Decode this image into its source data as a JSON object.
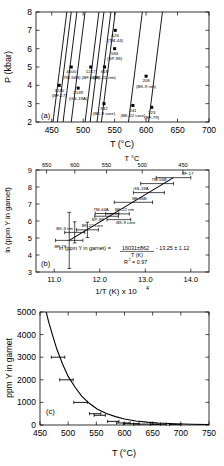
{
  "figure": {
    "panels": [
      "a",
      "b",
      "c"
    ]
  },
  "panel_a": {
    "tag": "(a)",
    "xlabel": "T (°C)",
    "ylabel": "P (kbar)",
    "xticks": [
      "450",
      "500",
      "550",
      "600",
      "650",
      "700"
    ],
    "yticks": [
      "2",
      "3",
      "4",
      "5",
      "6",
      "7",
      "8"
    ],
    "isopleth_labels": [
      "5000",
      "4000",
      "3000",
      "2000",
      "1000",
      "800",
      "600",
      "500",
      "200",
      "100 ppm"
    ],
    "points": [
      {
        "value": "3240",
        "sample": "(BF-17)"
      },
      {
        "value": "4000",
        "sample": "(TM-56B)"
      },
      {
        "value": "2149",
        "sample": "(GS-19A)"
      },
      {
        "value": "1217",
        "sample": "(BF-36B)"
      },
      {
        "value": "626",
        "sample": "(TM-44)"
      },
      {
        "value": "583",
        "sample": "(SP-98)"
      },
      {
        "value": "618",
        "sample": "(BK-22 rim)"
      },
      {
        "value": "332",
        "sample": "(BK-9 core)"
      },
      {
        "value": "208",
        "sample": "(BK-9 rim)"
      },
      {
        "value": "241",
        "sample": "(BK-22 core)"
      },
      {
        "value": "123",
        "sample": "(BF-79)"
      }
    ]
  },
  "panel_b": {
    "tag": "(b)",
    "xlabel_prefix": "1/T (K) x 10",
    "xlabel_exponent": "4",
    "ylabel": "ln (ppm Y in garnet)",
    "top_axis_label": "T °C",
    "xticks": [
      "11.0",
      "12.0",
      "13.0",
      "14.0"
    ],
    "yticks": [
      "3",
      "4",
      "5",
      "6",
      "7",
      "8",
      "9"
    ],
    "top_ticks": [
      "680",
      "650",
      "600",
      "550",
      "500",
      "450"
    ],
    "equation_lhs": "ln (ppm Y in garnet) =",
    "equation_numerator": "16031±862",
    "equation_denominator": "T (K)",
    "equation_intercept": "- 13.25 ± 1.12",
    "r_squared_label": "R",
    "r_squared_exponent": "2",
    "r_squared_value": "= 0.97",
    "sample_labels": [
      "BF-17",
      "TM-56B",
      "GS-19A",
      "BF-36B",
      "TM-44A",
      "SP-98",
      "BK-22 rim",
      "BK-9 core",
      "BK-9 rim",
      "BK-22 core",
      "BF-79"
    ]
  },
  "panel_c": {
    "tag": "(c)",
    "xlabel": "T (°C)",
    "ylabel": "ppm Y in garnet",
    "xticks": [
      "450",
      "500",
      "550",
      "600",
      "650",
      "700",
      "750"
    ],
    "yticks": [
      "0",
      "1000",
      "2000",
      "3000",
      "4000",
      "5000"
    ]
  },
  "chart_data": [
    {
      "type": "line",
      "panel": "a",
      "title": "",
      "xlabel": "T (°C)",
      "ylabel": "P (kbar)",
      "xlim": [
        425,
        700
      ],
      "ylim": [
        2,
        8
      ],
      "grid": false,
      "legend": "none",
      "annotations": [
        "(a)"
      ],
      "series": [
        {
          "name": "5000",
          "x": [
            452,
            474
          ],
          "y": [
            2.0,
            8.0
          ]
        },
        {
          "name": "4000",
          "x": [
            459,
            481
          ],
          "y": [
            2.0,
            8.0
          ]
        },
        {
          "name": "3000",
          "x": [
            468,
            490
          ],
          "y": [
            2.0,
            8.0
          ]
        },
        {
          "name": "2000",
          "x": [
            481,
            503
          ],
          "y": [
            2.0,
            8.0
          ]
        },
        {
          "name": "1000",
          "x": [
            503,
            525
          ],
          "y": [
            2.0,
            8.0
          ]
        },
        {
          "name": "800",
          "x": [
            511,
            533
          ],
          "y": [
            2.0,
            8.0
          ]
        },
        {
          "name": "600",
          "x": [
            522,
            544
          ],
          "y": [
            2.0,
            8.0
          ]
        },
        {
          "name": "500",
          "x": [
            529,
            551
          ],
          "y": [
            2.0,
            8.0
          ]
        },
        {
          "name": "200",
          "x": [
            572,
            594
          ],
          "y": [
            2.0,
            8.0
          ]
        },
        {
          "name": "100 ppm",
          "x": [
            604,
            626
          ],
          "y": [
            2.0,
            8.0
          ]
        }
      ],
      "points": [
        {
          "label": "3240",
          "sample": "(BF-17)",
          "T": 462,
          "P": 4.0
        },
        {
          "label": "4000",
          "sample": "(TM-56B)",
          "T": 481,
          "P": 5.0
        },
        {
          "label": "2149",
          "sample": "(GS-19A)",
          "T": 492,
          "P": 3.85
        },
        {
          "label": "1217",
          "sample": "(BF-36B)",
          "T": 512,
          "P": 5.0
        },
        {
          "label": "626",
          "sample": "(TM-44)",
          "T": 551,
          "P": 7.0
        },
        {
          "label": "583",
          "sample": "(SP-98)",
          "T": 550,
          "P": 6.0
        },
        {
          "label": "618",
          "sample": "(BK-22 rim)",
          "T": 534,
          "P": 5.0
        },
        {
          "label": "332",
          "sample": "(BK-9 core)",
          "T": 533,
          "P": 3.0
        },
        {
          "label": "208",
          "sample": "(BK-9 rim)",
          "T": 600,
          "P": 4.5
        },
        {
          "label": "241",
          "sample": "(BK-22 core)",
          "T": 579,
          "P": 2.9
        },
        {
          "label": "123",
          "sample": "(BF-79)",
          "T": 609,
          "P": 2.8
        }
      ]
    },
    {
      "type": "scatter",
      "panel": "b",
      "title": "",
      "xlabel": "1/T (K) x 10^4",
      "ylabel": "ln (ppm Y in garnet)",
      "xlim": [
        10.6,
        14.4
      ],
      "ylim": [
        3,
        9
      ],
      "grid": false,
      "legend": "none",
      "top_axis": {
        "label": "T °C",
        "ticks": [
          680,
          650,
          600,
          550,
          500,
          450
        ]
      },
      "annotations": [
        "(b)",
        "ln (ppm Y in garnet) = 16031±862 / T (K) - 13.25 ± 1.12",
        "R2 = 0.97"
      ],
      "fit": {
        "slope": 16031,
        "slope_err": 862,
        "intercept": -13.25,
        "intercept_err": 1.12,
        "r2": 0.97,
        "line_x": [
          11.33,
          13.62
        ],
        "line_y": [
          4.86,
          8.55
        ]
      },
      "points": [
        {
          "sample": "BF-17",
          "x": 13.62,
          "y": 8.55,
          "xerr": 0.38
        },
        {
          "sample": "TM-56B",
          "x": 13.26,
          "y": 8.2,
          "xerr": 0.36
        },
        {
          "sample": "GS-19A",
          "x": 13.08,
          "y": 7.67,
          "xerr": 0.34
        },
        {
          "sample": "BF-36B",
          "x": 12.74,
          "y": 7.1,
          "xerr": 0.42
        },
        {
          "sample": "TM-44A",
          "x": 12.16,
          "y": 6.44,
          "xerr": 0.26
        },
        {
          "sample": "SP-98",
          "x": 12.15,
          "y": 6.28,
          "xerr": 0.26
        },
        {
          "sample": "BK-22 rim",
          "x": 12.39,
          "y": 6.42,
          "xerr": 0.26
        },
        {
          "sample": "BK-9 core",
          "x": 12.42,
          "y": 6.08,
          "xerr": 0.26
        },
        {
          "sample": "BK-9 rim",
          "x": 11.45,
          "y": 5.33,
          "xerr": 0.22
        },
        {
          "sample": "BK-22 core",
          "x": 11.73,
          "y": 5.48,
          "xerr": 0.24
        },
        {
          "sample": "BF-79",
          "x": 11.33,
          "y": 4.86,
          "xerr": 0.3
        }
      ]
    },
    {
      "type": "line",
      "panel": "c",
      "title": "",
      "xlabel": "T (°C)",
      "ylabel": "ppm Y in garnet",
      "xlim": [
        450,
        750
      ],
      "ylim": [
        0,
        5000
      ],
      "grid": false,
      "legend": "none",
      "annotations": [
        "(c)"
      ],
      "curve": {
        "x": [
          458,
          465,
          472,
          480,
          490,
          500,
          512,
          524,
          538,
          552,
          568,
          584,
          600,
          620,
          640,
          660,
          690,
          720,
          750
        ],
        "y": [
          5300,
          4600,
          4000,
          3350,
          2700,
          2150,
          1680,
          1280,
          950,
          700,
          505,
          370,
          268,
          180,
          125,
          88,
          52,
          32,
          20
        ]
      },
      "points": [
        {
          "T": 482,
          "y": 3000,
          "xerr": 12
        },
        {
          "T": 497,
          "y": 2000,
          "xerr": 12
        },
        {
          "T": 522,
          "y": 1000,
          "xerr": 12
        },
        {
          "T": 548,
          "y": 500,
          "xerr": 10
        },
        {
          "T": 556,
          "y": 430,
          "xerr": 10
        },
        {
          "T": 580,
          "y": 160,
          "xerr": 10
        },
        {
          "T": 598,
          "y": 90,
          "xerr": 12
        },
        {
          "T": 612,
          "y": 60,
          "xerr": 14
        },
        {
          "T": 640,
          "y": 40,
          "xerr": 24
        },
        {
          "T": 660,
          "y": 30,
          "xerr": 14
        },
        {
          "T": 690,
          "y": 20,
          "xerr": 10
        }
      ]
    }
  ]
}
